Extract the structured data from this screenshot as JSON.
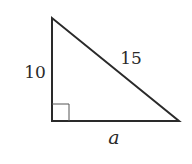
{
  "diagram": {
    "type": "right-triangle",
    "vertices": {
      "top": [
        52,
        18
      ],
      "right_angle": [
        52,
        121
      ],
      "right": [
        179,
        121
      ]
    },
    "right_angle_marker_size": 17,
    "stroke_color": "#2a2a2a",
    "labels": {
      "vertical_leg": "10",
      "hypotenuse": "15",
      "horizontal_leg": "a"
    }
  }
}
